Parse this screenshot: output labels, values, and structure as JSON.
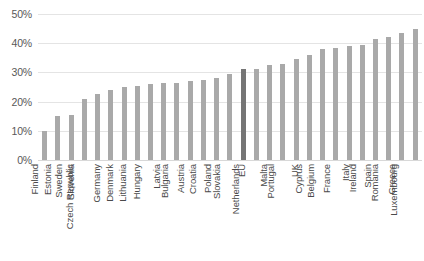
{
  "chart_data": {
    "type": "bar",
    "title": "",
    "subtitle": "",
    "xlabel": "",
    "ylabel": "",
    "ylim": [
      0,
      50
    ],
    "y_ticks": [
      0,
      10,
      20,
      30,
      40,
      50
    ],
    "y_tick_labels": [
      "0%",
      "10%",
      "20%",
      "30%",
      "40%",
      "50%"
    ],
    "grid": true,
    "legend": "none",
    "highlight_category": "EU",
    "highlight_color": "#757575",
    "bar_color": "#a9a9a9",
    "categories": [
      "Finland",
      "Estonia",
      "Sweden",
      "Slovenia",
      "Czech Republic",
      "Germany",
      "Denmark",
      "Lithuania",
      "Hungary",
      "Latvia",
      "Bulgaria",
      "Austria",
      "Croatia",
      "Poland",
      "Slovakia",
      "EU",
      "Netherlands",
      "Malta",
      "Portugal",
      "UK",
      "Cyprus",
      "Belgium",
      "France",
      "Italy",
      "Ireland",
      "Spain",
      "Romania",
      "Greece",
      "Luxembourg"
    ],
    "values": [
      10.0,
      15.0,
      15.5,
      21.0,
      22.5,
      24.0,
      25.0,
      25.5,
      26.0,
      26.5,
      26.5,
      27.0,
      27.5,
      28.0,
      29.5,
      31.0,
      31.0,
      32.5,
      33.0,
      34.5,
      36.0,
      38.0,
      38.5,
      39.0,
      39.5,
      41.5,
      42.0,
      43.5,
      45.0
    ]
  }
}
